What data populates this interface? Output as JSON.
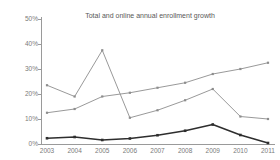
{
  "chart_data": {
    "type": "line",
    "title": "Total and online annual enrollment growth",
    "xlabel": "",
    "ylabel": "",
    "categories": [
      "2003",
      "2004",
      "2005",
      "2006",
      "2007",
      "2008",
      "2009",
      "2010",
      "2011"
    ],
    "ylim": [
      0,
      50
    ],
    "yticks": [
      0,
      10,
      20,
      30,
      40,
      50
    ],
    "ytick_labels": [
      "0%",
      "10%",
      "20%",
      "30%",
      "40%",
      "50%"
    ],
    "ytick_suffix": "%",
    "grid": false,
    "legend": "none",
    "series": [
      {
        "name": "series-light-gray",
        "color": "#8d8d8d",
        "marker": "square",
        "values": [
          23.5,
          19.0,
          37.5,
          10.5,
          13.5,
          17.5,
          22.0,
          11.0,
          10.0
        ]
      },
      {
        "name": "series-mid-gray",
        "color": "#8d8d8d",
        "marker": "square",
        "values": [
          12.5,
          14.0,
          19.0,
          20.5,
          22.5,
          24.5,
          28.0,
          30.0,
          32.5
        ]
      },
      {
        "name": "series-dark",
        "color": "#2e2e2e",
        "marker": "square",
        "values": [
          2.3,
          2.8,
          1.6,
          2.2,
          3.5,
          5.3,
          7.8,
          3.6,
          0.4
        ]
      }
    ]
  },
  "colors": {
    "axis": "#9a9a9a",
    "tick_text": "#7a7a7a",
    "title_text": "#585858",
    "background": "#ffffff",
    "light_gray_series": "#8d8d8d",
    "dark_series": "#2e2e2e"
  }
}
